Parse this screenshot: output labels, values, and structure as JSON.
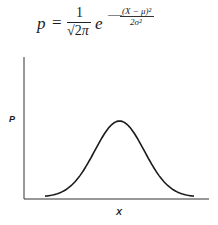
{
  "formula": {
    "lhs": "p",
    "equals": "=",
    "numerator": "1",
    "sqrt_radicand": "2",
    "pi": "π",
    "base": "e",
    "minus": "—",
    "exponent_numerator": "(X − μ)²",
    "exponent_denominator": "2σ²",
    "full_text": "p = 1/√(2π) e^(−(X − μ)²/2σ²)"
  },
  "axes": {
    "y_label": "P",
    "x_label": "X"
  },
  "chart_data": {
    "type": "line",
    "xlabel": "X",
    "ylabel": "P",
    "grid": false,
    "legend": null,
    "series": [
      {
        "name": "normal density",
        "x": [
          -3,
          -2.5,
          -2,
          -1.5,
          -1,
          -0.5,
          0,
          0.5,
          1,
          1.5,
          2,
          2.5,
          3
        ],
        "values": [
          0.004,
          0.018,
          0.054,
          0.13,
          0.242,
          0.352,
          0.399,
          0.352,
          0.242,
          0.13,
          0.054,
          0.018,
          0.004
        ]
      }
    ],
    "colors": {
      "curve": "#1a1a1a",
      "axes": "#333333"
    }
  }
}
